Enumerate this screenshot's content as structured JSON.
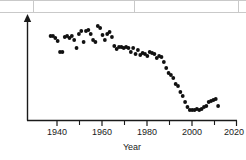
{
  "figure": {
    "background_color": "#ffffff",
    "dot_color": "#111111",
    "axis_color": "#1a1a1a",
    "table_border_color": "#c9c9c9"
  },
  "table_fragment": {
    "description": "partial table grid lines at top edge",
    "vertical_divider_x": [
      33,
      134,
      238
    ]
  },
  "axis": {
    "x_title": "Year",
    "y_title": "Number of measles cases",
    "x_major_ticks": [
      "1940",
      "1960",
      "1980",
      "2000",
      "2020"
    ],
    "x_minor_ticks": [
      "1950",
      "1970",
      "1990",
      "2010"
    ],
    "y_tick_labels": []
  },
  "chart_data": {
    "type": "scatter",
    "title": "",
    "xlabel": "Year",
    "ylabel": "Number of measles cases",
    "xlim": [
      1931,
      2020
    ],
    "ylim": [
      0,
      100
    ],
    "grid": false,
    "legend": "none",
    "x_major_ticks": [
      1940,
      1960,
      1980,
      2000,
      2020
    ],
    "x_minor_ticks": [
      1950,
      1970,
      1990,
      2010
    ],
    "y_axis_has_arrow": true,
    "y_axis_unlabeled": true,
    "marker": "filled-circle",
    "series": [
      {
        "name": "Number of measles cases",
        "x": [
          1941,
          1942,
          1943,
          1944,
          1945,
          1946,
          1947,
          1948,
          1949,
          1950,
          1951,
          1952,
          1953,
          1954,
          1955,
          1956,
          1957,
          1958,
          1959,
          1960,
          1961,
          1962,
          1963,
          1964,
          1965,
          1966,
          1967,
          1968,
          1969,
          1970,
          1971,
          1972,
          1973,
          1974,
          1975,
          1976,
          1977,
          1978,
          1979,
          1980,
          1981,
          1982,
          1983,
          1984,
          1985,
          1986,
          1987,
          1988,
          1989,
          1990,
          1991,
          1992,
          1993,
          1994,
          1995,
          1996,
          1997,
          1998,
          1999,
          2000,
          2001,
          2002,
          2003,
          2004,
          2005,
          2006,
          2007,
          2008,
          2009,
          2010,
          2011,
          2012
        ],
        "y": [
          84,
          84,
          82,
          79,
          68,
          68,
          83,
          84,
          82,
          84,
          80,
          72,
          86,
          89,
          78,
          89,
          90,
          86,
          80,
          78,
          94,
          92,
          85,
          80,
          86,
          88,
          83,
          74,
          71,
          73,
          73,
          72,
          73,
          72,
          68,
          72,
          66,
          70,
          65,
          67,
          66,
          64,
          68,
          67,
          66,
          62,
          64,
          63,
          58,
          52,
          47,
          45,
          42,
          36,
          34,
          28,
          24,
          18,
          13,
          10,
          10,
          10,
          11,
          10,
          11,
          13,
          14,
          18,
          19,
          20,
          21,
          14
        ]
      }
    ]
  }
}
